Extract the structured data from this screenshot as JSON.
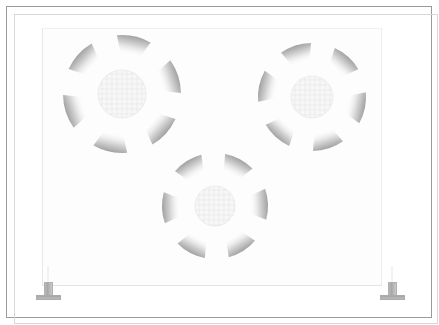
{
  "figure": {
    "width": 439,
    "height": 325,
    "background_color": "#ffffff",
    "frame": {
      "name": "outer-drawing-frame",
      "x": 6,
      "y": 6,
      "width": 426,
      "height": 312,
      "border_color": "#9a9a9a",
      "inner_hairline_color": "#d8d8d8"
    },
    "panel": {
      "name": "mounting-panel",
      "x": 42,
      "y": 28,
      "width": 340,
      "height": 258,
      "fill_color": "#fdfdfd",
      "edge_color": "#e8e8e8"
    }
  },
  "fans": [
    {
      "id": "fan-upper-left",
      "label": "Fan assembly 1",
      "center_x": 122,
      "center_y": 94,
      "hub_radius": 24,
      "blade_count": 6,
      "rotation_deg": 12,
      "blade_inner_radius": 27,
      "blade_outer_radius": 59,
      "blade_inner_half_width_deg": 9,
      "blade_outer_half_width_deg": 17,
      "hub_fill": "#f7f7f7",
      "hub_stroke": "#ededed",
      "blade_tip_color": "#8d8d8d",
      "blade_root_color": "#ffffff"
    },
    {
      "id": "fan-upper-right",
      "label": "Fan assembly 2",
      "center_x": 312,
      "center_y": 97,
      "hub_radius": 21,
      "blade_count": 6,
      "rotation_deg": -18,
      "blade_inner_radius": 24,
      "blade_outer_radius": 54,
      "blade_inner_half_width_deg": 9,
      "blade_outer_half_width_deg": 17,
      "hub_fill": "#f7f7f7",
      "hub_stroke": "#ededed",
      "blade_tip_color": "#8d8d8d",
      "blade_root_color": "#ffffff"
    },
    {
      "id": "fan-lower-center",
      "label": "Fan assembly 3",
      "center_x": 215,
      "center_y": 206,
      "hub_radius": 20,
      "blade_count": 6,
      "rotation_deg": 28,
      "blade_inner_radius": 23,
      "blade_outer_radius": 53,
      "blade_inner_half_width_deg": 9,
      "blade_outer_half_width_deg": 17,
      "hub_fill": "#f7f7f7",
      "hub_stroke": "#ededed",
      "blade_tip_color": "#8d8d8d",
      "blade_root_color": "#ffffff"
    }
  ],
  "feet": [
    {
      "id": "foot-left",
      "label": "Pedestal foot (left)",
      "x": 36,
      "y": 282,
      "post_color": "#aeaeae",
      "base_color": "#b2b2b2"
    },
    {
      "id": "foot-right",
      "label": "Pedestal foot (right)",
      "x": 380,
      "y": 282,
      "post_color": "#aeaeae",
      "base_color": "#b2b2b2"
    }
  ],
  "caption": "Faded technical line drawing: mounting panel carrying three six-bladed fan assemblies, supported on two pedestal feet."
}
